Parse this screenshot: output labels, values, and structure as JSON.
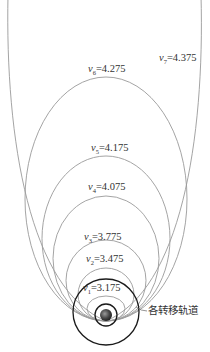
{
  "diagram": {
    "type": "transfer-orbits",
    "perigee_point": [
      106,
      321
    ],
    "colors": {
      "orbit": "#9a9a9a",
      "ring": "#1a1a1a",
      "text": "#333333",
      "earth": "#4a4a4a"
    },
    "orbits": [
      {
        "id": "v1",
        "symbol": "v",
        "sub": "1",
        "value": "=3.175",
        "top": 296,
        "half_width": 19,
        "label_x": 83,
        "label_y": 291
      },
      {
        "id": "v2",
        "symbol": "v",
        "sub": "2",
        "value": "=3.475",
        "top": 268,
        "half_width": 28,
        "label_x": 86,
        "label_y": 262
      },
      {
        "id": "v3",
        "symbol": "v",
        "sub": "3",
        "value": "=3.775",
        "top": 240,
        "half_width": 40,
        "label_x": 84,
        "label_y": 240
      },
      {
        "id": "v4",
        "symbol": "v",
        "sub": "4",
        "value": "=4.075",
        "top": 196,
        "half_width": 53,
        "label_x": 88,
        "label_y": 190
      },
      {
        "id": "v5",
        "symbol": "v",
        "sub": "5",
        "value": "=4.175",
        "top": 156,
        "half_width": 64,
        "label_x": 91,
        "label_y": 151
      },
      {
        "id": "v6",
        "symbol": "v",
        "sub": "6",
        "value": "=4.275",
        "top": 77,
        "half_width": 81,
        "label_x": 88,
        "label_y": 72
      },
      {
        "id": "v7",
        "symbol": "v",
        "sub": "7",
        "value": "=4.375",
        "open": true,
        "label_x": 159,
        "label_y": 61
      }
    ],
    "rings": [
      {
        "id": "outer-ring",
        "cx": 106,
        "cy": 312,
        "r": 33
      },
      {
        "id": "inner-ring",
        "cx": 106,
        "cy": 315,
        "r": 11
      }
    ],
    "earth": {
      "cx": 106,
      "cy": 315,
      "r": 6
    },
    "annotation": {
      "text": "各转移轨道",
      "x": 148,
      "y": 314
    }
  }
}
